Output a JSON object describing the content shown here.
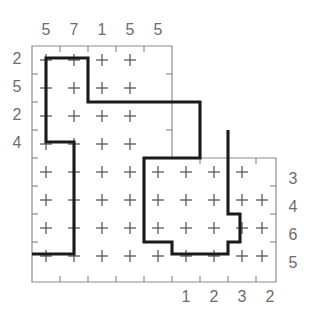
{
  "puzzle": {
    "title": "grid-path-puzzle",
    "grid": {
      "cell": 28,
      "origin_x": 32,
      "origin_y": 46,
      "upper_cols": 5,
      "upper_rows": 4,
      "total_rows": 8,
      "total_cols": 9
    },
    "clues": {
      "top": [
        "5",
        "7",
        "1",
        "5",
        "5"
      ],
      "left": [
        "2",
        "5",
        "2",
        "4"
      ],
      "right": [
        "3",
        "4",
        "6",
        "5"
      ],
      "bottom": [
        "1",
        "2",
        "3",
        "2"
      ]
    },
    "colors": {
      "background": "#ffffff",
      "frame": "#8d8d8d",
      "clue_text": "#6d6d6d",
      "plus_mark": "#5a5a5a",
      "path": "#1a1a1a"
    },
    "frame_outline": "M 32 46 L 172 46 L 172 158 L 276 158 L 276 282 L 32 282 Z",
    "bold_path": "M 32 254 L 74 254 L 74 142 L 46 142 L 46 58 L 88 58 L 88 102 L 200 102 L 200 158 L 144 158 L 144 242 L 172 242 L 172 254 L 228 254 L 228 242 L 240 242 L 240 214 L 228 214 L 228 130",
    "marks_upper": {
      "rows": 4,
      "cols": 5
    },
    "marks_lower": {
      "rows": 4,
      "cols": 9
    }
  }
}
